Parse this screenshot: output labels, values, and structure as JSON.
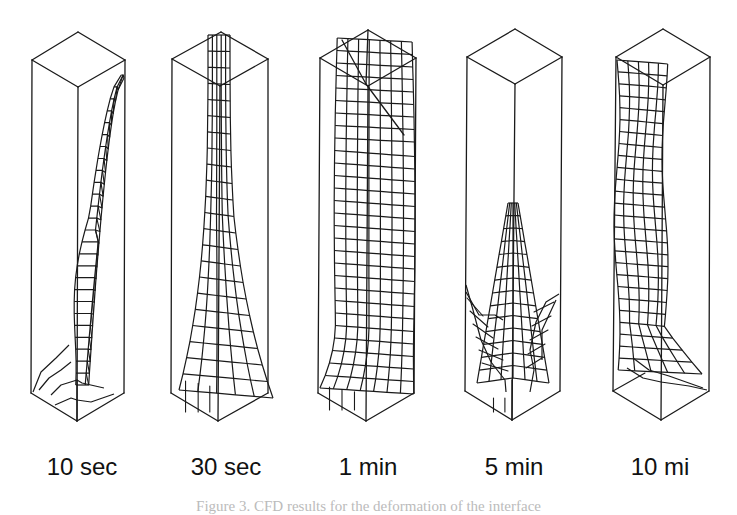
{
  "figure": {
    "panels": [
      {
        "label": "10 sec",
        "label_x": 82,
        "box": {
          "top_back": [
            78,
            32
          ],
          "top_left": [
            32,
            60
          ],
          "top_right": [
            125,
            60
          ],
          "top_front": [
            78,
            87
          ],
          "bot_left": [
            31,
            393
          ],
          "bot_front": [
            77,
            421
          ],
          "bot_right": [
            124,
            393
          ]
        },
        "surface": "thin-twisted-column"
      },
      {
        "label": "30 sec",
        "label_x": 226,
        "box": {
          "top_back": [
            221,
            32
          ],
          "top_left": [
            172,
            59
          ],
          "top_right": [
            268,
            59
          ],
          "top_front": [
            220,
            86
          ],
          "bot_left": [
            171,
            393
          ],
          "bot_front": [
            218,
            421
          ],
          "bot_right": [
            268,
            393
          ]
        },
        "surface": "curved-sheet"
      },
      {
        "label": "1 min",
        "label_x": 368,
        "box": {
          "top_back": [
            368,
            30
          ],
          "top_left": [
            320,
            58
          ],
          "top_right": [
            416,
            58
          ],
          "top_front": [
            368,
            86
          ],
          "bot_left": [
            318,
            393
          ],
          "bot_front": [
            366,
            421
          ],
          "bot_right": [
            414,
            393
          ]
        },
        "surface": "full-column"
      },
      {
        "label": "5 min",
        "label_x": 514,
        "box": {
          "top_back": [
            515,
            29
          ],
          "top_left": [
            467,
            57
          ],
          "top_right": [
            562,
            57
          ],
          "top_front": [
            515,
            84
          ],
          "bot_left": [
            465,
            391
          ],
          "bot_front": [
            512,
            420
          ],
          "bot_right": [
            560,
            391
          ]
        },
        "surface": "spike"
      },
      {
        "label": "10 mi",
        "label_x": 660,
        "box": {
          "top_back": [
            663,
            29
          ],
          "top_left": [
            616,
            57
          ],
          "top_right": [
            710,
            57
          ],
          "top_front": [
            663,
            85
          ],
          "bot_left": [
            613,
            391
          ],
          "bot_front": [
            661,
            420
          ],
          "bot_right": [
            709,
            391
          ]
        },
        "surface": "wall-column"
      }
    ],
    "caption": "Figure 3. CFD results for the deformation of the interface"
  },
  "colors": {
    "line": "#1a1a1a",
    "background": "#ffffff",
    "caption": "#bbbbbb"
  }
}
